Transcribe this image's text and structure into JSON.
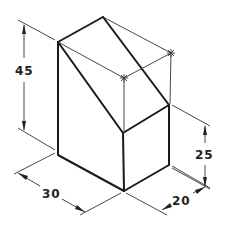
{
  "drawing": {
    "type": "isometric-dimensioned-block",
    "dimensions": {
      "height_total": "45",
      "height_short": "25",
      "width": "30",
      "depth": "20"
    },
    "colors": {
      "line": "#1a1a1a",
      "background": "#ffffff"
    }
  }
}
